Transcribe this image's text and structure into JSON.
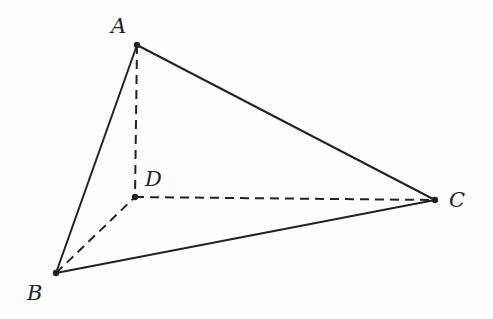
{
  "diagram": {
    "points": {
      "A": {
        "label": "A",
        "x": 137,
        "y": 45
      },
      "B": {
        "label": "B",
        "x": 56,
        "y": 273
      },
      "C": {
        "label": "C",
        "x": 435,
        "y": 200
      },
      "D": {
        "label": "D",
        "x": 135,
        "y": 197
      }
    },
    "solid_edges": [
      "AB",
      "AC",
      "BC"
    ],
    "dashed_edges": [
      "AD",
      "BD",
      "CD"
    ],
    "colors": {
      "line": "#222222",
      "background": "#fdfdfd"
    }
  }
}
